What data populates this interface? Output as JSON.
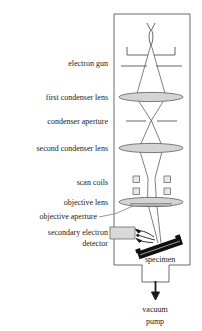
{
  "diagram": {
    "colors": {
      "outline": "#6b6b6b",
      "beam": "#555555",
      "lens_fill": "#d4d4d4",
      "lens_stroke": "#6b6b6b",
      "coil_fill": "#e8e8e8",
      "coil_stroke": "#6b6b6b",
      "detector_fill": "#d9d9d9",
      "detector_stroke": "#6b6b6b",
      "specimen_fill": "#101010",
      "text": "#1a1a1a",
      "background": "#ffffff"
    },
    "labels": {
      "electron_gun": "electron gun",
      "first_condenser_lens": "first condenser lens",
      "condenser_aperture": "condenser aperture",
      "second_condenser_lens": "second condenser lens",
      "scan_coils": "scan coils",
      "objective_lens": "objective lens",
      "objective_aperture": "objective aperture",
      "secondary_electron_detector_line1": "secondary electron",
      "secondary_electron_detector_line2": "detector",
      "specimen": "specimen",
      "vacuum_pump_line1": "vacuum",
      "vacuum_pump_line2": "pump"
    },
    "components": {
      "filament": "electron-gun-filament",
      "wehnelt_cap": "wehnelt-cap-bracket",
      "anode": "anode-plate",
      "condenser_aperture": "condenser-aperture-plate",
      "scan_coil_count": 4,
      "vacuum_arrow": "down-arrow"
    }
  }
}
